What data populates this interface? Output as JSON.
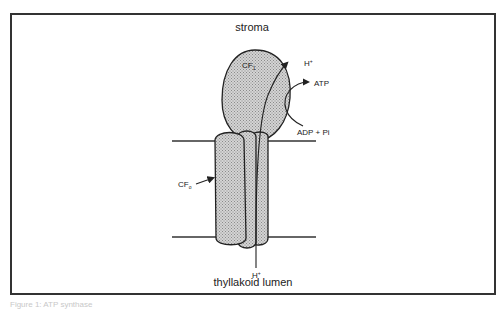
{
  "diagram": {
    "title_top": "stroma",
    "title_bottom": "thyllakoid lumen",
    "labels": {
      "cf1": "CF",
      "cf1_sub": "1",
      "cf0": "CF",
      "cf0_sub": "o",
      "proton_top": "H",
      "proton_top_sup": "+",
      "proton_bottom": "H",
      "proton_bottom_sup": "+",
      "atp": "ATP",
      "adp_pi": "ADP + Pi"
    },
    "colors": {
      "fill": "#c8c8c8",
      "stroke": "#222222",
      "frame": "#333333"
    }
  },
  "caption": "Figure 1: ATP synthase"
}
